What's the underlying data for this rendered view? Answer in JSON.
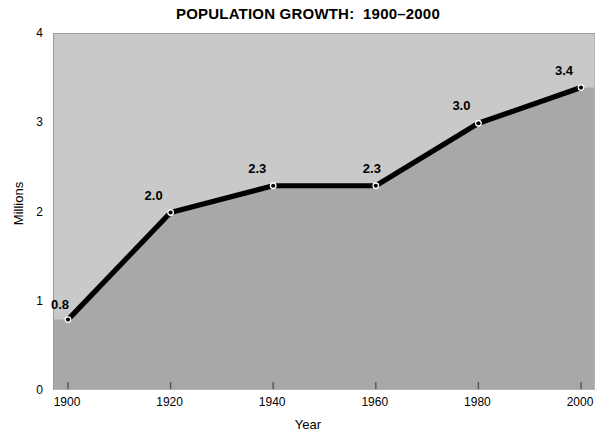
{
  "chart_data": {
    "type": "area",
    "title": "POPULATION GROWTH:  1900–2000",
    "xlabel": "Year",
    "ylabel": "Millions",
    "categories": [
      1900,
      1920,
      1940,
      1960,
      1980,
      2000
    ],
    "values": [
      0.8,
      2.0,
      2.3,
      2.3,
      3.0,
      3.4
    ],
    "point_labels": [
      "0.8",
      "2.0",
      "2.3",
      "2.3",
      "3.0",
      "3.4"
    ],
    "xlim": [
      1900,
      2000
    ],
    "ylim": [
      0,
      4
    ],
    "x_ticks": [
      "1900",
      "1920",
      "1940",
      "1960",
      "1980",
      "2000"
    ],
    "y_ticks": [
      "0",
      "1",
      "2",
      "3",
      "4"
    ],
    "grid": false,
    "legend": null,
    "colors": {
      "page_background": "#ffffff",
      "plot_background": "#c9c9c9",
      "area_fill": "#a8a8a8",
      "line": "#000000",
      "marker": "#000000",
      "text": "#000000",
      "tick": "#555555"
    }
  }
}
